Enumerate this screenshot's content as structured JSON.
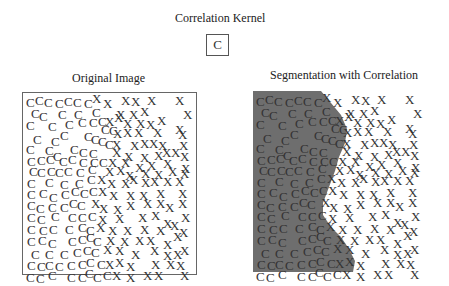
{
  "kernel": {
    "title": "Correlation Kernel",
    "symbol": "C"
  },
  "left_panel": {
    "title": "Original Image"
  },
  "right_panel": {
    "title": "Segmentation with Correlation",
    "segment_fill": "#6e6e6e"
  },
  "colors": {
    "text": "#333333",
    "border": "#666666",
    "segment": "#6e6e6e",
    "background": "#ffffff"
  },
  "glyphs": [
    [
      "C",
      3,
      3
    ],
    [
      "C",
      12,
      1
    ],
    [
      "C",
      21,
      3
    ],
    [
      "C",
      32,
      4
    ],
    [
      "C",
      41,
      2
    ],
    [
      "C",
      50,
      3
    ],
    [
      "C",
      61,
      4
    ],
    [
      "X",
      69,
      -1
    ],
    [
      "X",
      80,
      4
    ],
    [
      "X",
      98,
      1
    ],
    [
      "X",
      108,
      2
    ],
    [
      "X",
      124,
      1
    ],
    [
      "X",
      152,
      1
    ],
    [
      "C",
      8,
      14
    ],
    [
      "C",
      16,
      17
    ],
    [
      "C",
      35,
      15
    ],
    [
      "C",
      51,
      15
    ],
    [
      "C",
      69,
      13
    ],
    [
      "X",
      93,
      15
    ],
    [
      "X",
      106,
      15
    ],
    [
      "X",
      117,
      12
    ],
    [
      "X",
      160,
      15
    ],
    [
      "C",
      3,
      26
    ],
    [
      "C",
      25,
      27
    ],
    [
      "C",
      42,
      25
    ],
    [
      "C",
      55,
      23
    ],
    [
      "C",
      66,
      23
    ],
    [
      "C",
      75,
      22
    ],
    [
      "X",
      82,
      22
    ],
    [
      "X",
      91,
      18
    ],
    [
      "X",
      100,
      24
    ],
    [
      "X",
      113,
      24
    ],
    [
      "X",
      123,
      25
    ],
    [
      "X",
      134,
      21
    ],
    [
      "X",
      152,
      30
    ],
    [
      "C",
      78,
      30
    ],
    [
      "C",
      86,
      31
    ],
    [
      "X",
      90,
      34
    ],
    [
      "X",
      100,
      33
    ],
    [
      "X",
      111,
      33
    ],
    [
      "X",
      130,
      33
    ],
    [
      "X",
      155,
      35
    ],
    [
      "C",
      10,
      40
    ],
    [
      "C",
      28,
      42
    ],
    [
      "C",
      37,
      36
    ],
    [
      "C",
      61,
      37
    ],
    [
      "C",
      68,
      40
    ],
    [
      "C",
      75,
      42
    ],
    [
      "C",
      82,
      45
    ],
    [
      "X",
      89,
      45
    ],
    [
      "X",
      107,
      46
    ],
    [
      "X",
      117,
      44
    ],
    [
      "X",
      126,
      44
    ],
    [
      "X",
      135,
      46
    ],
    [
      "X",
      156,
      46
    ],
    [
      "C",
      3,
      50
    ],
    [
      "C",
      22,
      51
    ],
    [
      "C",
      47,
      50
    ],
    [
      "C",
      56,
      53
    ],
    [
      "C",
      66,
      54
    ],
    [
      "X",
      89,
      53
    ],
    [
      "X",
      101,
      57
    ],
    [
      "X",
      117,
      58
    ],
    [
      "X",
      131,
      56
    ],
    [
      "X",
      139,
      53
    ],
    [
      "X",
      148,
      53
    ],
    [
      "X",
      157,
      57
    ],
    [
      "C",
      4,
      62
    ],
    [
      "C",
      14,
      61
    ],
    [
      "C",
      23,
      60
    ],
    [
      "C",
      30,
      57
    ],
    [
      "C",
      36,
      62
    ],
    [
      "C",
      45,
      60
    ],
    [
      "C",
      56,
      63
    ],
    [
      "C",
      67,
      63
    ],
    [
      "C",
      76,
      63
    ],
    [
      "X",
      85,
      63
    ],
    [
      "X",
      98,
      63
    ],
    [
      "X",
      112,
      68
    ],
    [
      "X",
      124,
      66
    ],
    [
      "X",
      140,
      64
    ],
    [
      "X",
      158,
      69
    ],
    [
      "C",
      6,
      72
    ],
    [
      "C",
      14,
      73
    ],
    [
      "C",
      24,
      72
    ],
    [
      "C",
      32,
      73
    ],
    [
      "C",
      41,
      72
    ],
    [
      "C",
      53,
      73
    ],
    [
      "C",
      65,
      70
    ],
    [
      "X",
      82,
      72
    ],
    [
      "X",
      93,
      71
    ],
    [
      "X",
      102,
      76
    ],
    [
      "X",
      118,
      74
    ],
    [
      "X",
      131,
      75
    ],
    [
      "X",
      145,
      72
    ],
    [
      "X",
      157,
      74
    ],
    [
      "C",
      4,
      84
    ],
    [
      "C",
      22,
      83
    ],
    [
      "C",
      37,
      85
    ],
    [
      "C",
      52,
      84
    ],
    [
      "C",
      64,
      80
    ],
    [
      "X",
      74,
      80
    ],
    [
      "X",
      84,
      84
    ],
    [
      "X",
      98,
      84
    ],
    [
      "X",
      106,
      80
    ],
    [
      "X",
      118,
      83
    ],
    [
      "X",
      127,
      82
    ],
    [
      "X",
      140,
      82
    ],
    [
      "X",
      152,
      82
    ],
    [
      "C",
      4,
      95
    ],
    [
      "C",
      16,
      94
    ],
    [
      "C",
      26,
      98
    ],
    [
      "C",
      38,
      95
    ],
    [
      "C",
      48,
      92
    ],
    [
      "C",
      57,
      94
    ],
    [
      "C",
      66,
      92
    ],
    [
      "X",
      75,
      92
    ],
    [
      "X",
      86,
      96
    ],
    [
      "X",
      103,
      96
    ],
    [
      "X",
      116,
      96
    ],
    [
      "X",
      133,
      94
    ],
    [
      "X",
      155,
      94
    ],
    [
      "C",
      4,
      106
    ],
    [
      "C",
      13,
      109
    ],
    [
      "C",
      25,
      108
    ],
    [
      "C",
      37,
      108
    ],
    [
      "C",
      46,
      104
    ],
    [
      "C",
      54,
      106
    ],
    [
      "X",
      68,
      104
    ],
    [
      "X",
      76,
      109
    ],
    [
      "X",
      90,
      110
    ],
    [
      "X",
      103,
      106
    ],
    [
      "X",
      120,
      104
    ],
    [
      "X",
      133,
      104
    ],
    [
      "X",
      142,
      108
    ],
    [
      "X",
      155,
      104
    ],
    [
      "C",
      4,
      118
    ],
    [
      "C",
      14,
      120
    ],
    [
      "C",
      28,
      117
    ],
    [
      "C",
      45,
      118
    ],
    [
      "C",
      55,
      118
    ],
    [
      "C",
      65,
      117
    ],
    [
      "X",
      75,
      120
    ],
    [
      "X",
      92,
      119
    ],
    [
      "X",
      115,
      118
    ],
    [
      "X",
      128,
      116
    ],
    [
      "X",
      140,
      124
    ],
    [
      "X",
      158,
      118
    ],
    [
      "C",
      4,
      130
    ],
    [
      "C",
      16,
      131
    ],
    [
      "C",
      26,
      130
    ],
    [
      "C",
      42,
      130
    ],
    [
      "C",
      55,
      128
    ],
    [
      "C",
      63,
      131
    ],
    [
      "X",
      73,
      128
    ],
    [
      "X",
      85,
      131
    ],
    [
      "X",
      100,
      131
    ],
    [
      "X",
      117,
      130
    ],
    [
      "X",
      133,
      131
    ],
    [
      "X",
      147,
      126
    ],
    [
      "X",
      156,
      133
    ],
    [
      "C",
      4,
      142
    ],
    [
      "C",
      15,
      141
    ],
    [
      "C",
      25,
      144
    ],
    [
      "C",
      45,
      142
    ],
    [
      "C",
      55,
      140
    ],
    [
      "C",
      63,
      138
    ],
    [
      "C",
      70,
      142
    ],
    [
      "X",
      83,
      141
    ],
    [
      "X",
      97,
      142
    ],
    [
      "X",
      112,
      141
    ],
    [
      "X",
      123,
      141
    ],
    [
      "X",
      140,
      145
    ],
    [
      "X",
      150,
      137
    ],
    [
      "C",
      8,
      155
    ],
    [
      "C",
      22,
      155
    ],
    [
      "C",
      37,
      155
    ],
    [
      "C",
      50,
      153
    ],
    [
      "C",
      60,
      151
    ],
    [
      "C",
      68,
      153
    ],
    [
      "X",
      80,
      150
    ],
    [
      "X",
      92,
      151
    ],
    [
      "X",
      108,
      155
    ],
    [
      "X",
      127,
      151
    ],
    [
      "X",
      140,
      156
    ],
    [
      "X",
      150,
      155
    ],
    [
      "X",
      157,
      151
    ],
    [
      "C",
      4,
      166
    ],
    [
      "C",
      14,
      167
    ],
    [
      "C",
      22,
      166
    ],
    [
      "C",
      32,
      167
    ],
    [
      "C",
      44,
      166
    ],
    [
      "C",
      55,
      165
    ],
    [
      "C",
      63,
      163
    ],
    [
      "C",
      74,
      165
    ],
    [
      "X",
      82,
      165
    ],
    [
      "X",
      92,
      163
    ],
    [
      "X",
      103,
      167
    ],
    [
      "X",
      128,
      165
    ],
    [
      "X",
      143,
      165
    ],
    [
      "X",
      153,
      166
    ],
    [
      "C",
      3,
      178
    ],
    [
      "C",
      13,
      179
    ],
    [
      "C",
      25,
      176
    ],
    [
      "C",
      44,
      178
    ],
    [
      "C",
      55,
      178
    ],
    [
      "C",
      62,
      174
    ],
    [
      "C",
      70,
      178
    ],
    [
      "C",
      80,
      176
    ],
    [
      "X",
      89,
      176
    ],
    [
      "X",
      103,
      178
    ],
    [
      "X",
      120,
      176
    ],
    [
      "X",
      131,
      176
    ],
    [
      "X",
      157,
      176
    ]
  ]
}
